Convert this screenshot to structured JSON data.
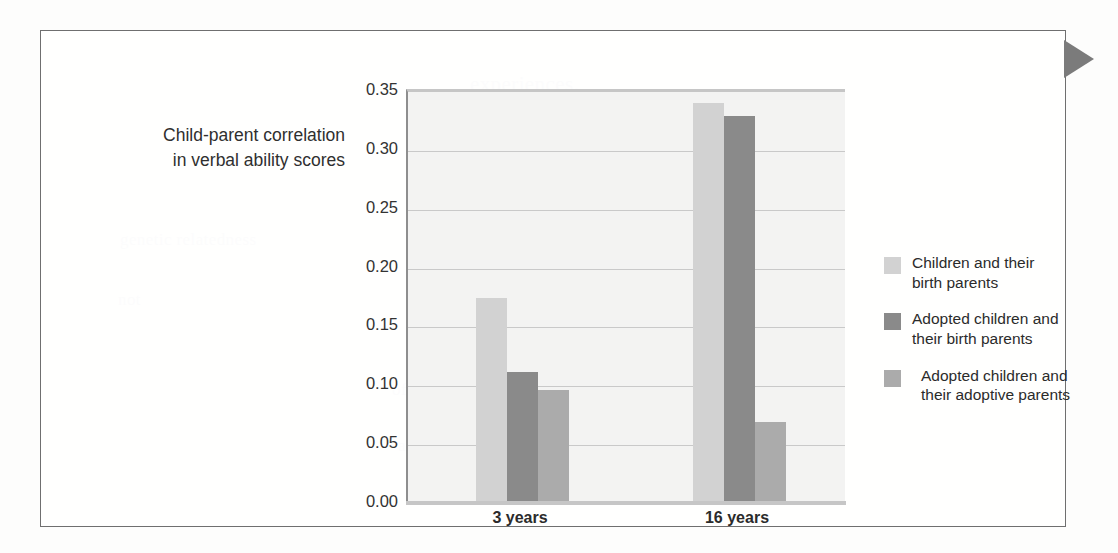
{
  "figure": {
    "edge_marker": "triangle-right"
  },
  "chart_data": {
    "type": "bar",
    "title": "",
    "xlabel": "",
    "ylabel": "Child-parent correlation in verbal ability scores",
    "ylabel_lines": [
      "Child-parent correlation",
      "in verbal ability scores"
    ],
    "categories": [
      "3 years",
      "16 years"
    ],
    "ylim": [
      0.0,
      0.35
    ],
    "ytick_step": 0.05,
    "ytick_labels": [
      "0.00",
      "0.05",
      "0.10",
      "0.15",
      "0.20",
      "0.25",
      "0.30",
      "0.35"
    ],
    "ytick_values": [
      0.0,
      0.05,
      0.1,
      0.15,
      0.2,
      0.25,
      0.3,
      0.35
    ],
    "grid": true,
    "legend_position": "right",
    "series": [
      {
        "name": "Children and their birth parents",
        "name_lines": [
          "Children and their",
          "birth parents"
        ],
        "color": "#d2d2d2",
        "values": [
          0.175,
          0.341
        ]
      },
      {
        "name": "Adopted children and their birth parents",
        "name_lines": [
          "Adopted children and",
          "their birth parents"
        ],
        "color": "#8a8a8a",
        "values": [
          0.112,
          0.33
        ]
      },
      {
        "name": "Adopted children and their adoptive parents",
        "name_lines": [
          "Adopted children and",
          "their adoptive parents"
        ],
        "color": "#ababab",
        "values": [
          0.097,
          0.07
        ]
      }
    ]
  },
  "bleed_text": [
    {
      "text": "experiences.",
      "x": 470,
      "y": 72,
      "size": 21
    },
    {
      "text": "shared the same environment, such as",
      "x": 418,
      "y": 140,
      "size": 19
    },
    {
      "text": "siblings growing up together, and those",
      "x": 452,
      "y": 168,
      "size": 17
    },
    {
      "text": "who were reared apart. In this way",
      "x": 462,
      "y": 196,
      "size": 17
    },
    {
      "text": "investigators can estimate heritability",
      "x": 452,
      "y": 224,
      "size": 17
    },
    {
      "text": "of cognitive ability across the lifespan",
      "x": 392,
      "y": 380,
      "size": 17
    },
    {
      "text": "and across varied populations of",
      "x": 398,
      "y": 436,
      "size": 17
    },
    {
      "text": "genetic relatedness",
      "x": 120,
      "y": 230,
      "size": 17
    },
    {
      "text": "not",
      "x": 118,
      "y": 290,
      "size": 17
    }
  ]
}
